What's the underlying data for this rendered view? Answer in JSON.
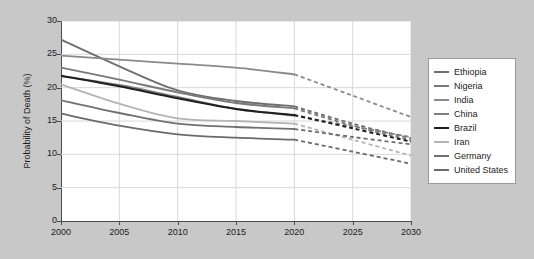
{
  "chart_data": {
    "type": "line",
    "title": "",
    "xlabel": "",
    "ylabel": "Probability of Death (%)",
    "xlim": [
      2000,
      2030
    ],
    "ylim": [
      0,
      30
    ],
    "xticks": [
      2000,
      2005,
      2010,
      2015,
      2020,
      2025,
      2030
    ],
    "yticks": [
      0,
      5,
      10,
      15,
      20,
      25,
      30
    ],
    "grid": true,
    "legend_position": "right",
    "x": [
      2000,
      2005,
      2010,
      2015,
      2020,
      2025,
      2030
    ],
    "projection_start_year": 2020,
    "note": "Solid segments cover 2000-2020 (observed); dashed segments cover 2020-2030 (projected).",
    "series": [
      {
        "name": "Ethiopia",
        "color": "#6e6e6e",
        "width": 1.8,
        "values": [
          27.2,
          23.2,
          19.6,
          18.0,
          17.2,
          14.6,
          12.4
        ]
      },
      {
        "name": "Nigeria",
        "color": "#787878",
        "width": 1.8,
        "values": [
          23.0,
          21.2,
          19.3,
          17.7,
          16.9,
          14.3,
          12.1
        ]
      },
      {
        "name": "India",
        "color": "#8a8a8a",
        "width": 1.8,
        "values": [
          24.8,
          24.2,
          23.6,
          23.0,
          22.0,
          18.8,
          15.6
        ]
      },
      {
        "name": "China",
        "color": "#808080",
        "width": 1.8,
        "values": [
          21.7,
          20.4,
          18.6,
          16.8,
          15.8,
          14.2,
          12.6
        ]
      },
      {
        "name": "Brazil",
        "color": "#1f1f1f",
        "width": 2.0,
        "values": [
          21.8,
          20.2,
          18.4,
          16.8,
          15.9,
          13.9,
          11.9
        ]
      },
      {
        "name": "Iran",
        "color": "#b4b4b4",
        "width": 1.8,
        "values": [
          20.5,
          17.6,
          15.4,
          15.0,
          14.6,
          12.2,
          9.8
        ]
      },
      {
        "name": "Germany",
        "color": "#707070",
        "width": 1.8,
        "values": [
          18.1,
          16.2,
          14.6,
          14.1,
          13.8,
          12.6,
          11.5
        ]
      },
      {
        "name": "United States",
        "color": "#6a6a6a",
        "width": 1.8,
        "values": [
          16.1,
          14.3,
          13.0,
          12.5,
          12.2,
          10.4,
          8.6
        ]
      }
    ]
  }
}
